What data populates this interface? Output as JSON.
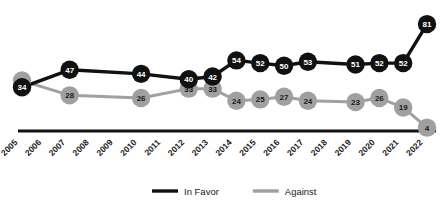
{
  "chart_data": {
    "type": "line",
    "title": "",
    "subtitle": "",
    "xlabel": "",
    "ylabel": "",
    "grid": false,
    "legend_position": "bottom-center",
    "categories": [
      "2005",
      "2006",
      "2007",
      "2008",
      "2009",
      "2010",
      "2011",
      "2012",
      "2013",
      "2014",
      "2015",
      "2016",
      "2017",
      "2018",
      "2019",
      "2020",
      "2021",
      "2022"
    ],
    "xlim": [
      2005,
      2022
    ],
    "ylim": [
      0,
      90
    ],
    "series": [
      {
        "name": "In Favor",
        "color": "#111111",
        "points": [
          {
            "x": "2005",
            "y": 34,
            "label": "34",
            "marker": true
          },
          {
            "x": "2007",
            "y": 47,
            "label": "47",
            "marker": true
          },
          {
            "x": "2010",
            "y": 44,
            "label": "44",
            "marker": true
          },
          {
            "x": "2012",
            "y": 40,
            "label": "40",
            "marker": true
          },
          {
            "x": "2013",
            "y": 42,
            "label": "42",
            "marker": true
          },
          {
            "x": "2014",
            "y": 54,
            "label": "54",
            "marker": true
          },
          {
            "x": "2015",
            "y": 52,
            "label": "52",
            "marker": true
          },
          {
            "x": "2016",
            "y": 50,
            "label": "50",
            "marker": true
          },
          {
            "x": "2017",
            "y": 53,
            "label": "53",
            "marker": true
          },
          {
            "x": "2019",
            "y": 51,
            "label": "51",
            "marker": true
          },
          {
            "x": "2020",
            "y": 52,
            "label": "52",
            "marker": true
          },
          {
            "x": "2021",
            "y": 52,
            "label": "52",
            "marker": true
          },
          {
            "x": "2022",
            "y": 81,
            "label": "81",
            "marker": true
          }
        ]
      },
      {
        "name": "Against",
        "color": "#a0a0a0",
        "points": [
          {
            "x": "2005",
            "y": 39,
            "label": "39",
            "marker": true
          },
          {
            "x": "2007",
            "y": 28,
            "label": "28",
            "marker": true
          },
          {
            "x": "2010",
            "y": 26,
            "label": "26",
            "marker": true
          },
          {
            "x": "2012",
            "y": 33,
            "label": "33",
            "marker": true
          },
          {
            "x": "2013",
            "y": 33,
            "label": "33",
            "marker": true
          },
          {
            "x": "2014",
            "y": 24,
            "label": "24",
            "marker": true
          },
          {
            "x": "2015",
            "y": 25,
            "label": "25",
            "marker": true
          },
          {
            "x": "2016",
            "y": 27,
            "label": "27",
            "marker": true
          },
          {
            "x": "2017",
            "y": 24,
            "label": "24",
            "marker": true
          },
          {
            "x": "2019",
            "y": 23,
            "label": "23",
            "marker": true
          },
          {
            "x": "2020",
            "y": 26,
            "label": "26",
            "marker": true
          },
          {
            "x": "2021",
            "y": 19,
            "label": "19",
            "marker": true
          },
          {
            "x": "2022",
            "y": 4,
            "label": "4",
            "marker": true
          }
        ]
      }
    ],
    "legend": [
      {
        "label": "In Favor",
        "color": "#111111"
      },
      {
        "label": "Against",
        "color": "#a0a0a0"
      }
    ],
    "axis": {
      "line_color": "#111111",
      "x_ticks": [
        "2005",
        "2006",
        "2007",
        "2008",
        "2009",
        "2010",
        "2011",
        "2012",
        "2013",
        "2014",
        "2015",
        "2016",
        "2017",
        "2018",
        "2019",
        "2020",
        "2021",
        "2022"
      ],
      "tick_rotation": -45
    }
  }
}
